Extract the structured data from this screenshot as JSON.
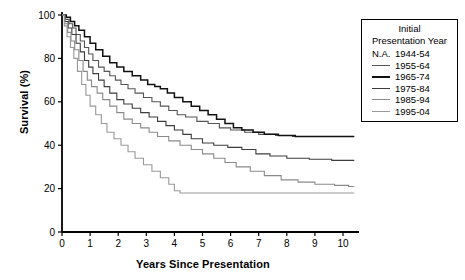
{
  "chart_data": {
    "type": "line",
    "title": "",
    "xlabel": "Years Since Presentation",
    "ylabel": "Survival (%)",
    "xlim": [
      0,
      10.5
    ],
    "ylim": [
      0,
      100
    ],
    "xticks": [
      "0",
      "1",
      "2",
      "3",
      "4",
      "5",
      "6",
      "7",
      "8",
      "9",
      "10"
    ],
    "yticks": [
      "0",
      "20",
      "40",
      "60",
      "80",
      "100"
    ],
    "grid": false,
    "legend_position": "top-right-outside",
    "legend_title_line1": "Initial",
    "legend_title_line2": "Presentation Year",
    "series": [
      {
        "name": "N.A. 1944-54",
        "legend_marker": "N.A.",
        "color": "#1a1a1a",
        "width": 1.1,
        "points": [
          [
            0,
            100
          ]
        ]
      },
      {
        "name": "1955-64",
        "legend_marker": "line",
        "color": "#555555",
        "width": 1.1,
        "points": [
          [
            0,
            100
          ],
          [
            0.12,
            98
          ],
          [
            0.25,
            96
          ],
          [
            0.38,
            94
          ],
          [
            0.5,
            91
          ],
          [
            0.65,
            88
          ],
          [
            0.8,
            85
          ],
          [
            0.95,
            82
          ],
          [
            1.1,
            79
          ],
          [
            1.3,
            76
          ],
          [
            1.5,
            74
          ],
          [
            1.7,
            72
          ],
          [
            1.9,
            70
          ],
          [
            2.1,
            68
          ],
          [
            2.35,
            66
          ],
          [
            2.6,
            64
          ],
          [
            2.9,
            62
          ],
          [
            3.2,
            60
          ],
          [
            3.5,
            58
          ],
          [
            3.8,
            56
          ],
          [
            4.1,
            54
          ],
          [
            4.4,
            53
          ],
          [
            4.8,
            51
          ],
          [
            5.2,
            50
          ],
          [
            5.6,
            48
          ],
          [
            6.0,
            47
          ],
          [
            6.5,
            46
          ],
          [
            7.0,
            45
          ],
          [
            7.6,
            44.5
          ],
          [
            8.2,
            44
          ],
          [
            9.0,
            44
          ],
          [
            10.4,
            44
          ]
        ]
      },
      {
        "name": "1965-74",
        "legend_marker": "line",
        "color": "#111111",
        "width": 1.5,
        "points": [
          [
            0,
            100
          ],
          [
            0.15,
            99
          ],
          [
            0.3,
            97
          ],
          [
            0.45,
            95
          ],
          [
            0.6,
            93
          ],
          [
            0.8,
            90
          ],
          [
            1.0,
            87
          ],
          [
            1.2,
            84
          ],
          [
            1.45,
            81
          ],
          [
            1.7,
            78
          ],
          [
            1.95,
            76
          ],
          [
            2.2,
            74
          ],
          [
            2.5,
            72
          ],
          [
            2.8,
            70
          ],
          [
            3.05,
            68
          ],
          [
            3.3,
            67
          ],
          [
            3.5,
            66
          ],
          [
            3.75,
            64
          ],
          [
            4.0,
            62
          ],
          [
            4.3,
            60
          ],
          [
            4.6,
            58
          ],
          [
            4.9,
            56
          ],
          [
            5.2,
            54
          ],
          [
            5.5,
            52
          ],
          [
            5.8,
            50
          ],
          [
            6.1,
            48
          ],
          [
            6.4,
            47
          ],
          [
            6.8,
            46
          ],
          [
            7.2,
            45
          ],
          [
            7.7,
            44.5
          ],
          [
            8.3,
            44
          ],
          [
            9.2,
            44
          ],
          [
            10.4,
            44
          ]
        ]
      },
      {
        "name": "1975-84",
        "legend_marker": "line",
        "color": "#3d3d3d",
        "width": 1.1,
        "points": [
          [
            0,
            100
          ],
          [
            0.1,
            97
          ],
          [
            0.22,
            94
          ],
          [
            0.35,
            91
          ],
          [
            0.5,
            87
          ],
          [
            0.65,
            83
          ],
          [
            0.8,
            79
          ],
          [
            0.95,
            76
          ],
          [
            1.1,
            73
          ],
          [
            1.3,
            70
          ],
          [
            1.5,
            67
          ],
          [
            1.7,
            64
          ],
          [
            1.95,
            61
          ],
          [
            2.2,
            59
          ],
          [
            2.5,
            57
          ],
          [
            2.8,
            55
          ],
          [
            3.1,
            53
          ],
          [
            3.4,
            51
          ],
          [
            3.7,
            49
          ],
          [
            4.0,
            47
          ],
          [
            4.3,
            45
          ],
          [
            4.6,
            43
          ],
          [
            5.0,
            41
          ],
          [
            5.4,
            40
          ],
          [
            5.9,
            39
          ],
          [
            6.4,
            38
          ],
          [
            6.9,
            36
          ],
          [
            7.4,
            35
          ],
          [
            8.0,
            34
          ],
          [
            8.8,
            33.5
          ],
          [
            9.6,
            33
          ],
          [
            10.4,
            33
          ]
        ]
      },
      {
        "name": "1985-94",
        "legend_marker": "line",
        "color": "#8a8a8a",
        "width": 1.1,
        "points": [
          [
            0,
            100
          ],
          [
            0.1,
            96
          ],
          [
            0.2,
            92
          ],
          [
            0.32,
            88
          ],
          [
            0.45,
            84
          ],
          [
            0.6,
            79
          ],
          [
            0.75,
            74
          ],
          [
            0.9,
            70
          ],
          [
            1.05,
            67
          ],
          [
            1.25,
            64
          ],
          [
            1.45,
            61
          ],
          [
            1.7,
            58
          ],
          [
            1.95,
            55
          ],
          [
            2.2,
            52
          ],
          [
            2.5,
            50
          ],
          [
            2.8,
            48
          ],
          [
            3.1,
            46
          ],
          [
            3.4,
            44
          ],
          [
            3.8,
            42
          ],
          [
            4.2,
            40
          ],
          [
            4.6,
            38
          ],
          [
            5.0,
            36
          ],
          [
            5.4,
            34
          ],
          [
            5.8,
            32
          ],
          [
            6.2,
            30
          ],
          [
            6.7,
            28
          ],
          [
            7.2,
            26
          ],
          [
            7.8,
            24
          ],
          [
            8.4,
            23
          ],
          [
            9.0,
            22
          ],
          [
            9.7,
            21.5
          ],
          [
            10.2,
            21
          ],
          [
            10.4,
            21
          ]
        ]
      },
      {
        "name": "1995-04",
        "legend_marker": "line",
        "color": "#999999",
        "width": 1.1,
        "points": [
          [
            0,
            100
          ],
          [
            0.08,
            95
          ],
          [
            0.18,
            90
          ],
          [
            0.3,
            85
          ],
          [
            0.42,
            80
          ],
          [
            0.55,
            74
          ],
          [
            0.7,
            68
          ],
          [
            0.85,
            63
          ],
          [
            1.0,
            58
          ],
          [
            1.2,
            54
          ],
          [
            1.4,
            50
          ],
          [
            1.6,
            46
          ],
          [
            1.85,
            43
          ],
          [
            2.1,
            40
          ],
          [
            2.35,
            37
          ],
          [
            2.6,
            34
          ],
          [
            2.9,
            31
          ],
          [
            3.2,
            28
          ],
          [
            3.5,
            25
          ],
          [
            3.8,
            22
          ],
          [
            4.0,
            19
          ],
          [
            4.2,
            18
          ],
          [
            5.0,
            18
          ],
          [
            6.0,
            18
          ],
          [
            7.0,
            18
          ],
          [
            8.0,
            18
          ],
          [
            9.0,
            18
          ],
          [
            10.4,
            18
          ]
        ]
      }
    ]
  }
}
